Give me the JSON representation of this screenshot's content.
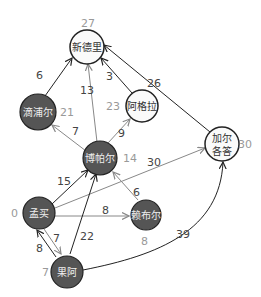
{
  "header": {
    "truncated_caption": ""
  },
  "colors": {
    "dark_node": "#555555",
    "light_node": "#fafafa",
    "edge_dark": "#222222",
    "edge_light": "#888888",
    "distance_label": "#999999",
    "weight_label": "#444444"
  },
  "nodes": [
    {
      "id": "delhi",
      "label": "新德里",
      "distance": "27",
      "visited": false
    },
    {
      "id": "jaipur",
      "label": "滴浦尔",
      "distance": "21",
      "visited": true
    },
    {
      "id": "agra",
      "label": "阿格拉",
      "distance": "23",
      "visited": false
    },
    {
      "id": "bhopal",
      "label": "博帕尔",
      "distance": "14",
      "visited": true
    },
    {
      "id": "kolkata",
      "label_line1": "加尔",
      "label_line2": "各答",
      "distance": "30",
      "visited": false
    },
    {
      "id": "mumbai",
      "label": "孟买",
      "distance": "0",
      "visited": true
    },
    {
      "id": "raipur",
      "label": "赖布尔",
      "distance": "8",
      "visited": true
    },
    {
      "id": "goa",
      "label": "果阿",
      "distance": "7",
      "visited": true
    }
  ],
  "edges": [
    {
      "from": "jaipur",
      "to": "delhi",
      "weight": "6"
    },
    {
      "from": "bhopal",
      "to": "delhi",
      "weight": "13"
    },
    {
      "from": "agra",
      "to": "delhi",
      "weight": "3"
    },
    {
      "from": "kolkata",
      "to": "delhi",
      "weight": "26"
    },
    {
      "from": "bhopal",
      "to": "jaipur",
      "weight": "7"
    },
    {
      "from": "bhopal",
      "to": "agra",
      "weight": "9"
    },
    {
      "from": "mumbai",
      "to": "bhopal",
      "weight": "15"
    },
    {
      "from": "mumbai",
      "to": "kolkata",
      "weight": "30"
    },
    {
      "from": "raipur",
      "to": "bhopal",
      "weight": "6"
    },
    {
      "from": "mumbai",
      "to": "raipur",
      "weight": "8"
    },
    {
      "from": "mumbai",
      "to": "goa",
      "weight": "7"
    },
    {
      "from": "goa",
      "to": "mumbai",
      "weight": "8"
    },
    {
      "from": "goa",
      "to": "bhopal",
      "weight": "22"
    },
    {
      "from": "goa",
      "to": "kolkata",
      "weight": "39"
    }
  ]
}
